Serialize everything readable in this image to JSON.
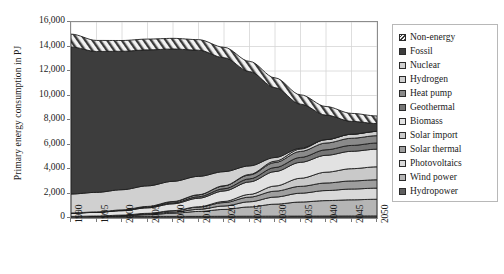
{
  "chart_data": {
    "type": "area",
    "title": "",
    "xlabel": "",
    "ylabel": "Primary energy consumption in PJ",
    "stacked": true,
    "grid": true,
    "legend_position": "right",
    "xlim": [
      1990,
      2050
    ],
    "ylim": [
      0,
      16000
    ],
    "ytick_labels": [
      "16,000",
      "14,000",
      "12,000",
      "10,000",
      "8,000",
      "6,000",
      "4,000",
      "2,000",
      "0"
    ],
    "ytick_values": [
      16000,
      14000,
      12000,
      10000,
      8000,
      6000,
      4000,
      2000,
      0
    ],
    "xtick_labels": [
      "1990",
      "1995",
      "2000",
      "2005",
      "2010",
      "2015",
      "2020",
      "2025",
      "2030",
      "2035",
      "2040",
      "2045",
      "2050"
    ],
    "x": [
      1990,
      1995,
      2000,
      2005,
      2010,
      2015,
      2020,
      2025,
      2030,
      2035,
      2040,
      2045,
      2050
    ],
    "series": [
      {
        "name": "Hydropower",
        "color": "#5f5f5f",
        "pattern": "solid",
        "values": [
          120,
          120,
          125,
          130,
          130,
          135,
          140,
          145,
          150,
          155,
          160,
          165,
          170
        ]
      },
      {
        "name": "Wind power",
        "color": "#b5b5b5",
        "pattern": "solid",
        "values": [
          5,
          20,
          60,
          140,
          260,
          400,
          560,
          760,
          980,
          1150,
          1260,
          1320,
          1360
        ]
      },
      {
        "name": "Photovoltaics",
        "color": "#d9d9d9",
        "pattern": "solid",
        "values": [
          0,
          5,
          15,
          40,
          90,
          170,
          280,
          420,
          580,
          720,
          820,
          880,
          910
        ]
      },
      {
        "name": "Solar thermal",
        "color": "#9e9e9e",
        "pattern": "solid",
        "values": [
          5,
          15,
          35,
          70,
          120,
          190,
          280,
          380,
          480,
          560,
          620,
          660,
          680
        ]
      },
      {
        "name": "Solar import",
        "color": "#c9c9c9",
        "pattern": "solid",
        "values": [
          0,
          0,
          0,
          0,
          0,
          20,
          90,
          220,
          420,
          660,
          880,
          1000,
          1060
        ]
      },
      {
        "name": "Biomass",
        "color": "#e2e2e2",
        "pattern": "solid",
        "values": [
          260,
          300,
          360,
          450,
          560,
          700,
          860,
          1020,
          1180,
          1300,
          1380,
          1420,
          1440
        ]
      },
      {
        "name": "Geothermal",
        "color": "#767676",
        "pattern": "solid",
        "values": [
          10,
          15,
          25,
          45,
          75,
          120,
          180,
          250,
          330,
          400,
          450,
          480,
          500
        ]
      },
      {
        "name": "Heat pump",
        "color": "#8a8a8a",
        "pattern": "solid",
        "values": [
          10,
          20,
          40,
          70,
          110,
          165,
          235,
          320,
          410,
          490,
          550,
          585,
          600
        ]
      },
      {
        "name": "Hydrogen",
        "color": "#cfcfcf",
        "pattern": "solid",
        "values": [
          0,
          0,
          0,
          0,
          0,
          0,
          10,
          40,
          110,
          200,
          280,
          330,
          350
        ]
      },
      {
        "name": "Nuclear",
        "color": "#d0d0d0",
        "pattern": "solid",
        "values": [
          1550,
          1600,
          1650,
          1680,
          1650,
          1500,
          1150,
          700,
          300,
          60,
          0,
          0,
          0
        ]
      },
      {
        "name": "Fossil",
        "color": "#3d3d3d",
        "pattern": "solid",
        "values": [
          12000,
          11500,
          11300,
          11100,
          10800,
          10300,
          9300,
          7700,
          5700,
          3600,
          2000,
          1050,
          640
        ]
      },
      {
        "name": "Non-energy",
        "color": "#efefef",
        "pattern": "diagonal-hatch",
        "values": [
          1050,
          900,
          880,
          880,
          870,
          860,
          850,
          830,
          800,
          760,
          700,
          650,
          620
        ]
      }
    ],
    "totals": [
      15010,
      14495,
      14490,
      14605,
      14565,
      14560,
      13935,
      12785,
      11440,
      9655,
      8100,
      7540,
      7330
    ]
  },
  "legend": {
    "items": [
      {
        "label": "Non-energy",
        "color": "#efefef"
      },
      {
        "label": "Fossil",
        "color": "#3d3d3d"
      },
      {
        "label": "Nuclear",
        "color": "#d0d0d0"
      },
      {
        "label": "Hydrogen",
        "color": "#cfcfcf"
      },
      {
        "label": "Heat pump",
        "color": "#8a8a8a"
      },
      {
        "label": "Geothermal",
        "color": "#767676"
      },
      {
        "label": "Biomass",
        "color": "#e2e2e2"
      },
      {
        "label": "Solar import",
        "color": "#c9c9c9"
      },
      {
        "label": "Solar thermal",
        "color": "#9e9e9e"
      },
      {
        "label": "Photovoltaics",
        "color": "#d9d9d9"
      },
      {
        "label": "Wind power",
        "color": "#b5b5b5"
      },
      {
        "label": "Hydropower",
        "color": "#5f5f5f"
      }
    ]
  }
}
